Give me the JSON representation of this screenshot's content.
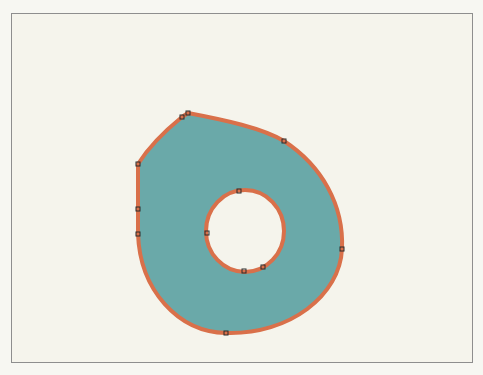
{
  "canvas": {
    "background": "#f5f4ec",
    "frame_border_color": "#8e8e8e"
  },
  "shape": {
    "name": "donut-drop-shape",
    "fill": "#6aa9a9",
    "stroke": "#d9704a",
    "stroke_width": 4,
    "outer_path": "M188,113 C225,120 262,128 284,141 C322,166 344,205 342,249 C340,295 290,335 226,333 C178,332 140,290 138,234 L138,209 L138,164 C150,145 166,130 182,117 Z",
    "inner_ellipse": {
      "cx": 245,
      "cy": 231,
      "rx": 39,
      "ry": 41
    },
    "anchor_points": [
      {
        "x": 188,
        "y": 113
      },
      {
        "x": 182,
        "y": 117
      },
      {
        "x": 284,
        "y": 141
      },
      {
        "x": 342,
        "y": 249
      },
      {
        "x": 226,
        "y": 333
      },
      {
        "x": 138,
        "y": 234
      },
      {
        "x": 138,
        "y": 209
      },
      {
        "x": 138,
        "y": 164
      },
      {
        "x": 239,
        "y": 191
      },
      {
        "x": 207,
        "y": 233
      },
      {
        "x": 244,
        "y": 271
      },
      {
        "x": 263,
        "y": 267
      }
    ]
  }
}
